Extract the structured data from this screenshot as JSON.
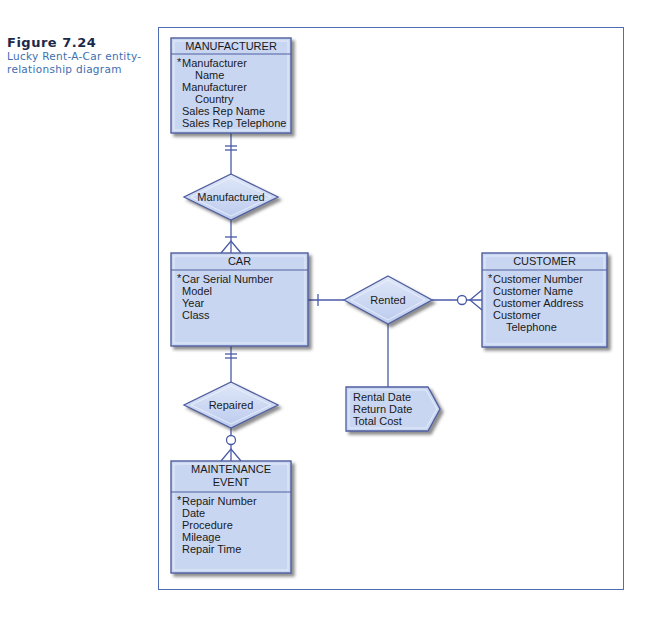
{
  "caption": {
    "figure_label": "Figure 7.24",
    "description": "Lucky Rent-A-Car entity-relationship diagram"
  },
  "colors": {
    "entity_fill": "#c9d6f2",
    "entity_border": "#4f5e9e",
    "line": "#4a5aa8",
    "frame": "#4f6bb3",
    "caption_title": "#1c2a4a",
    "caption_text": "#3d6fb0"
  },
  "entities": {
    "manufacturer": {
      "title": [
        "MANUFACTURER"
      ],
      "attributes": [
        {
          "text": "Manufacturer",
          "key": true,
          "indent": false
        },
        {
          "text": "Name",
          "key": false,
          "indent": true
        },
        {
          "text": "Manufacturer",
          "key": false,
          "indent": false
        },
        {
          "text": "Country",
          "key": false,
          "indent": true
        },
        {
          "text": "Sales Rep Name",
          "key": false,
          "indent": false
        },
        {
          "text": "Sales Rep Telephone",
          "key": false,
          "indent": false
        }
      ]
    },
    "car": {
      "title": [
        "CAR"
      ],
      "attributes": [
        {
          "text": "Car Serial Number",
          "key": true,
          "indent": false
        },
        {
          "text": "Model",
          "key": false,
          "indent": false
        },
        {
          "text": "Year",
          "key": false,
          "indent": false
        },
        {
          "text": "Class",
          "key": false,
          "indent": false
        }
      ]
    },
    "customer": {
      "title": [
        "CUSTOMER"
      ],
      "attributes": [
        {
          "text": "Customer Number",
          "key": true,
          "indent": false
        },
        {
          "text": "Customer Name",
          "key": false,
          "indent": false
        },
        {
          "text": "Customer Address",
          "key": false,
          "indent": false
        },
        {
          "text": "Customer",
          "key": false,
          "indent": false
        },
        {
          "text": "Telephone",
          "key": false,
          "indent": true
        }
      ]
    },
    "maintenance_event": {
      "title": [
        "MAINTENANCE",
        "EVENT"
      ],
      "attributes": [
        {
          "text": "Repair Number",
          "key": true,
          "indent": false
        },
        {
          "text": "Date",
          "key": false,
          "indent": false
        },
        {
          "text": "Procedure",
          "key": false,
          "indent": false
        },
        {
          "text": "Mileage",
          "key": false,
          "indent": false
        },
        {
          "text": "Repair Time",
          "key": false,
          "indent": false
        }
      ]
    }
  },
  "relationships": {
    "manufactured": {
      "label": "Manufactured",
      "from": "MANUFACTURER",
      "to": "CAR",
      "from_cardinality": "one-and-only-one",
      "to_cardinality": "one-or-many"
    },
    "rented": {
      "label": "Rented",
      "from": "CAR",
      "to": "CUSTOMER",
      "from_cardinality": "one-or-many",
      "to_cardinality": "zero-or-many"
    },
    "repaired": {
      "label": "Repaired",
      "from": "CAR",
      "to": "MAINTENANCE EVENT",
      "from_cardinality": "one-and-only-one",
      "to_cardinality": "zero-or-many"
    }
  },
  "rental_attributes": [
    "Rental Date",
    "Return Date",
    "Total Cost"
  ],
  "key_marker": "*"
}
